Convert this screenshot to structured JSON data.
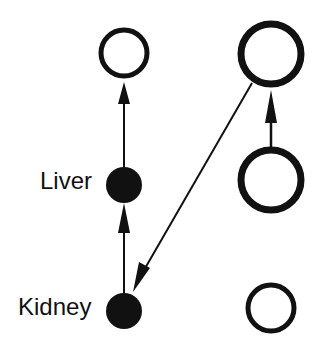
{
  "diagram": {
    "colors": {
      "background": "#ffffff",
      "ink": "#111111"
    },
    "nodes": [
      {
        "id": "left-top",
        "label": "",
        "filled": false,
        "cx": 124,
        "cy": 53,
        "r": 23,
        "stroke_width": 5
      },
      {
        "id": "liver",
        "label": "Liver",
        "filled": true,
        "cx": 124,
        "cy": 185,
        "r": 18
      },
      {
        "id": "kidney",
        "label": "Kidney",
        "filled": true,
        "cx": 124,
        "cy": 311,
        "r": 18
      },
      {
        "id": "right-top",
        "label": "",
        "filled": false,
        "cx": 271,
        "cy": 54,
        "r": 30,
        "stroke_width": 7
      },
      {
        "id": "right-middle",
        "label": "",
        "filled": false,
        "cx": 271,
        "cy": 180,
        "r": 30,
        "stroke_width": 7
      },
      {
        "id": "right-bottom",
        "label": "",
        "filled": false,
        "cx": 271,
        "cy": 308,
        "r": 23,
        "stroke_width": 5
      }
    ],
    "edges": [
      {
        "from": "liver",
        "to": "left-top"
      },
      {
        "from": "kidney",
        "to": "liver"
      },
      {
        "from": "right-middle",
        "to": "right-top"
      },
      {
        "from": "right-top",
        "to": "kidney"
      }
    ],
    "labels": {
      "liver": "Liver",
      "kidney": "Kidney"
    }
  }
}
